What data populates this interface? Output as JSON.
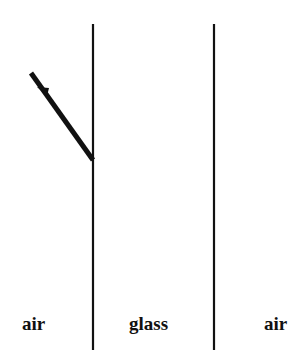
{
  "diagram": {
    "type": "refraction-setup",
    "regions": [
      {
        "label": "air",
        "x": 38
      },
      {
        "label": "glass",
        "x": 154
      },
      {
        "label": "air",
        "x": 278
      }
    ],
    "boundaries": [
      {
        "x": 93,
        "y1": 24,
        "y2": 350
      },
      {
        "x": 214,
        "y1": 24,
        "y2": 350
      }
    ],
    "incident_ray": {
      "x1": 30,
      "y1": 72,
      "x2": 93,
      "y2": 160,
      "arrow_pos": 0.25
    },
    "colors": {
      "line": "#111111",
      "background": "#ffffff"
    }
  }
}
